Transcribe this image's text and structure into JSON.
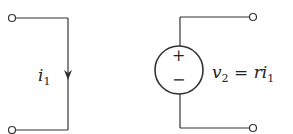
{
  "diagram": {
    "type": "circuit",
    "left_branch": {
      "current_label": "i",
      "current_subscript": "1",
      "direction": "down"
    },
    "right_branch": {
      "source_type": "dependent voltage source",
      "plus_sign": "+",
      "minus_sign": "−",
      "voltage_label": "v",
      "voltage_subscript": "2",
      "equation_eq": " = ri",
      "equation_subscript": "1"
    },
    "colors": {
      "line": "#333333",
      "background": "#ffffff"
    }
  }
}
